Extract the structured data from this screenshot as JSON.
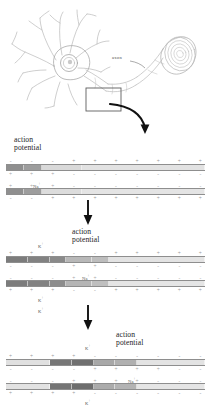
{
  "figure": {
    "neuron": {
      "axon_label": "axon",
      "callout_box_name": "axon-membrane-callout",
      "parts": [
        "cell-body",
        "dendrites",
        "axon",
        "myelin-sheath",
        "myelin-cross-section"
      ]
    },
    "panels": [
      {
        "id": "panel-1",
        "stage": 1,
        "action_potential_label": "action\npotential",
        "action_potential_x_pct": 15,
        "ion_labels": [
          {
            "name": "sodium",
            "text": "Na",
            "charge": "+",
            "x_pct": 17,
            "position": "between-membranes"
          }
        ],
        "outer_charges": [
          "-",
          "-",
          "-",
          "+",
          "+",
          "+",
          "+",
          "+",
          "+",
          "+"
        ],
        "inner_charges_top": [
          "+",
          "+",
          "+",
          "-",
          "-",
          "-",
          "-",
          "-",
          "-",
          "-"
        ],
        "inner_charges_bottom": [
          "+",
          "+",
          "+",
          "-",
          "-",
          "-",
          "-",
          "-",
          "-",
          "-"
        ],
        "lower_outer_charges": [
          "-",
          "-",
          "+",
          "+",
          "+",
          "+",
          "+",
          "+",
          "+",
          "+"
        ],
        "upper_membrane_segments": [
          {
            "shade": "#8f8f8f",
            "width_pct": 9
          },
          {
            "shade": "#9d9d9d",
            "width_pct": 9
          },
          {
            "shade": "#d9d9d9",
            "width_pct": 20
          },
          {
            "shade": "#e2e2e2",
            "width_pct": 62
          }
        ],
        "lower_membrane_segments": [
          {
            "shade": "#8f8f8f",
            "width_pct": 9
          },
          {
            "shade": "#9d9d9d",
            "width_pct": 9
          },
          {
            "shade": "#dcdcdc",
            "width_pct": 20
          },
          {
            "shade": "#e4e4e4",
            "width_pct": 62
          }
        ]
      },
      {
        "id": "panel-2",
        "stage": 2,
        "action_potential_label": "action\npotential",
        "action_potential_x_pct": 36,
        "ion_labels": [
          {
            "name": "potassium-upper",
            "text": "K",
            "charge": "+",
            "x_pct": 19,
            "position": "above-membrane"
          },
          {
            "name": "sodium",
            "text": "Na",
            "charge": "+",
            "x_pct": 40,
            "position": "between-membranes"
          },
          {
            "name": "potassium-lower",
            "text": "K",
            "charge": "+",
            "x_pct": 19,
            "position": "below-membrane"
          }
        ],
        "outer_charges": [
          "+",
          "+",
          "+",
          "-",
          "-",
          "+",
          "+",
          "+",
          "+",
          "+"
        ],
        "inner_charges_top": [
          "-",
          "-",
          "-",
          "+",
          "+",
          "-",
          "-",
          "-",
          "-",
          "-"
        ],
        "inner_charges_bottom": [
          "-",
          "-",
          "-",
          "+",
          "+",
          "-",
          "-",
          "-",
          "-",
          "-"
        ],
        "lower_outer_charges": [
          "+",
          "+",
          "+",
          "-",
          "-",
          "+",
          "+",
          "+",
          "+",
          "+"
        ],
        "upper_membrane_segments": [
          {
            "shade": "#7c7c7c",
            "width_pct": 11
          },
          {
            "shade": "#828282",
            "width_pct": 11
          },
          {
            "shade": "#8a8a8a",
            "width_pct": 8
          },
          {
            "shade": "#b8b8b8",
            "width_pct": 13
          },
          {
            "shade": "#bdbdbd",
            "width_pct": 9
          },
          {
            "shade": "#e3e3e3",
            "width_pct": 48
          }
        ],
        "lower_membrane_segments": [
          {
            "shade": "#7c7c7c",
            "width_pct": 11
          },
          {
            "shade": "#828282",
            "width_pct": 11
          },
          {
            "shade": "#8d8d8d",
            "width_pct": 8
          },
          {
            "shade": "#b5b5b5",
            "width_pct": 13
          },
          {
            "shade": "#bfbfbf",
            "width_pct": 9
          },
          {
            "shade": "#e5e5e5",
            "width_pct": 48
          }
        ]
      },
      {
        "id": "panel-3",
        "stage": 3,
        "action_potential_label": "action\npotential",
        "action_potential_x_pct": 57,
        "ion_labels": [
          {
            "name": "potassium-above-arrow",
            "text": "K",
            "charge": "+",
            "x_pct": 19,
            "position": "far-above"
          },
          {
            "name": "potassium-upper",
            "text": "K",
            "charge": "+",
            "x_pct": 41,
            "position": "above-membrane"
          },
          {
            "name": "sodium",
            "text": "Na",
            "charge": "+",
            "x_pct": 62,
            "position": "between-membranes"
          },
          {
            "name": "potassium-lower",
            "text": "K",
            "charge": "+",
            "x_pct": 41,
            "position": "below-membrane"
          }
        ],
        "outer_charges": [
          "+",
          "+",
          "+",
          "+",
          "-",
          "-",
          "-",
          "-",
          "-",
          "-"
        ],
        "inner_charges_top": [
          "-",
          "-",
          "-",
          "-",
          "+",
          "+",
          "+",
          "+",
          "-",
          "-"
        ],
        "inner_charges_bottom": [
          "-",
          "-",
          "-",
          "+",
          "+",
          "+",
          "+",
          "-",
          "-",
          "-"
        ],
        "lower_outer_charges": [
          "+",
          "+",
          "+",
          "+",
          "-",
          "-",
          "-",
          "-",
          "-",
          "-"
        ],
        "upper_membrane_segments": [
          {
            "shade": "#e0e0e0",
            "width_pct": 22
          },
          {
            "shade": "#777777",
            "width_pct": 11
          },
          {
            "shade": "#707070",
            "width_pct": 11
          },
          {
            "shade": "#a8a8a8",
            "width_pct": 11
          },
          {
            "shade": "#b0b0b0",
            "width_pct": 11
          },
          {
            "shade": "#e3e3e3",
            "width_pct": 34
          }
        ],
        "lower_membrane_segments": [
          {
            "shade": "#e2e2e2",
            "width_pct": 22
          },
          {
            "shade": "#757575",
            "width_pct": 11
          },
          {
            "shade": "#6e6e6e",
            "width_pct": 11
          },
          {
            "shade": "#ababab",
            "width_pct": 11
          },
          {
            "shade": "#b3b3b3",
            "width_pct": 11
          },
          {
            "shade": "#e5e5e5",
            "width_pct": 34
          }
        ]
      }
    ],
    "flow_arrows": [
      {
        "name": "flow-arrow-1",
        "from": "panel-1",
        "to": "panel-2"
      },
      {
        "name": "flow-arrow-2",
        "from": "panel-2",
        "to": "panel-3"
      }
    ],
    "colors": {
      "membrane_dark": "#707070",
      "membrane_mid": "#b0b0b0",
      "membrane_light": "#e3e3e3",
      "charge_symbol": "#9a9a9a",
      "text": "#232323",
      "line": "#8e8e8e"
    }
  }
}
